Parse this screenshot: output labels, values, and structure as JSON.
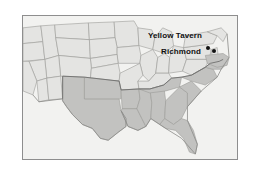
{
  "figure": {
    "type": "map",
    "background_color": "#ffffff",
    "frame_color": "#8e8e8e"
  },
  "map": {
    "water_color": "#f2f2f0",
    "unshaded_state_color": "#e4e4e2",
    "shaded_state_color": "#c2c2c0",
    "state_border_color": "#9a9a98",
    "coast_border_color": "#8a8a88",
    "shaded_region_label": "Confederate States",
    "markers": [
      {
        "name": "Yellow Tavern",
        "label": "Yellow Tavern",
        "label_x": 168,
        "label_y": 33,
        "dot_x": 205,
        "dot_y": 45,
        "dot_color": "#111111"
      },
      {
        "name": "Richmond",
        "label": "Richmond",
        "label_x": 175,
        "label_y": 49,
        "dot_x": 211,
        "dot_y": 48,
        "dot_color": "#111111"
      }
    ]
  }
}
